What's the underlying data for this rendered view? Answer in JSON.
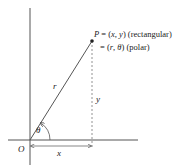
{
  "diagram": {
    "point_label": "P = (x, y) (rectangular)",
    "point_label_parts": {
      "P": "P",
      "eq1": " = (",
      "x": "x",
      "comma1": ", ",
      "y": "y",
      "close1": ") (rectangular)"
    },
    "polar_label_parts": {
      "eq2": "= (",
      "r": "r",
      "comma2": ", ",
      "theta": "θ",
      "close2": ") (polar)"
    },
    "radius_label": "r",
    "vertical_label": "y",
    "horizontal_label": "x",
    "angle_label": "θ",
    "origin_label": "O",
    "colors": {
      "line": "#555555",
      "text": "#222222"
    }
  }
}
